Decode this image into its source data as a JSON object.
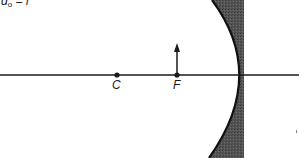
{
  "diagram": {
    "type": "concave-mirror-ray-diagram",
    "condition_label": {
      "var": "d",
      "subscript": "o",
      "rest": " = f"
    },
    "points": [
      {
        "id": "C",
        "label": "C",
        "x": 117,
        "y": 75
      },
      {
        "id": "F",
        "label": "F",
        "x": 177,
        "y": 75
      }
    ],
    "object": {
      "label": "object-arrow",
      "x": 177,
      "base_y": 75,
      "tip_y": 44
    },
    "principal_axis": {
      "y": 75,
      "x_start": 0,
      "x_end": 299
    },
    "mirror": {
      "vertex_x": 239,
      "back_x": 244,
      "fill": "#4a4a4a",
      "edge": "#111111"
    }
  }
}
